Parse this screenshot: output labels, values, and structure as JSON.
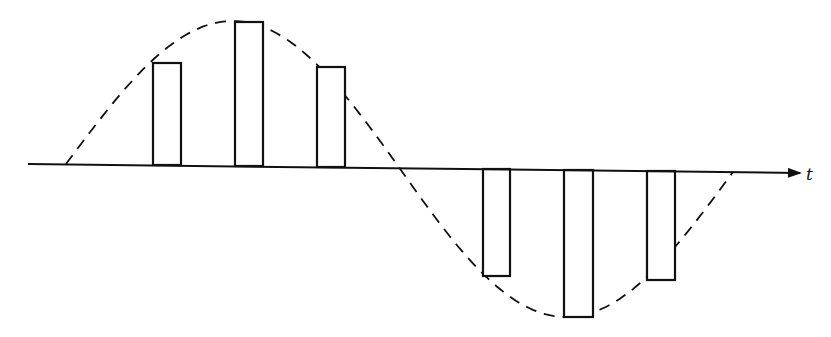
{
  "diagram": {
    "axis": {
      "label": "t",
      "x_start": 28,
      "x_end": 800,
      "y_left": 164,
      "y_right": 173
    },
    "envelope": {
      "style": "dashed",
      "shape": "sine",
      "start": [
        66,
        164
      ],
      "peak": [
        235,
        21
      ],
      "zero_crossing": [
        398,
        168
      ],
      "trough": [
        565,
        317
      ],
      "end": [
        733,
        172
      ]
    },
    "pulses": [
      {
        "index": 1,
        "x": 153,
        "width": 28,
        "amplitude": "positive",
        "top": 63,
        "bottom": 165
      },
      {
        "index": 2,
        "x": 235,
        "width": 28,
        "amplitude": "positive",
        "top": 22,
        "bottom": 166
      },
      {
        "index": 3,
        "x": 317,
        "width": 28,
        "amplitude": "positive",
        "top": 67,
        "bottom": 167
      },
      {
        "index": 4,
        "x": 483,
        "width": 27,
        "amplitude": "negative",
        "top": 169,
        "bottom": 276
      },
      {
        "index": 5,
        "x": 564,
        "width": 29,
        "amplitude": "negative",
        "top": 170,
        "bottom": 317
      },
      {
        "index": 6,
        "x": 647,
        "width": 28,
        "amplitude": "negative",
        "top": 171,
        "bottom": 280
      }
    ],
    "colors": {
      "stroke": "#111111",
      "background": "#ffffff"
    }
  }
}
